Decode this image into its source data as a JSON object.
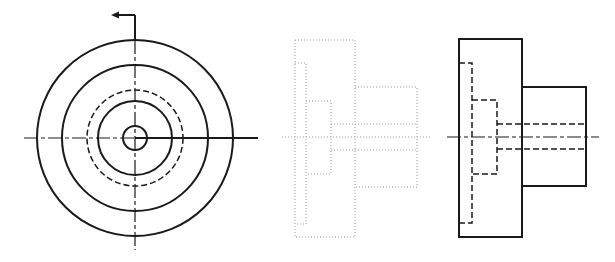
{
  "drawing": {
    "type": "orthographic multiview technical drawing",
    "colors": {
      "line": "#1a1a1a",
      "construction": "#9a9a9a",
      "background": "#ffffff"
    },
    "views": [
      {
        "name": "front-circular-view",
        "center": [
          135,
          138
        ],
        "circles": [
          {
            "r": 98,
            "style": "solid"
          },
          {
            "r": 73,
            "style": "solid"
          },
          {
            "r": 48,
            "style": "hidden"
          },
          {
            "r": 37,
            "style": "solid"
          },
          {
            "r": 12,
            "style": "solid"
          }
        ],
        "cutting_plane_arrow": "left"
      },
      {
        "name": "middle-dotted-side-view",
        "style": "dotted"
      },
      {
        "name": "right-side-view",
        "style": "solid-with-hidden"
      }
    ]
  }
}
